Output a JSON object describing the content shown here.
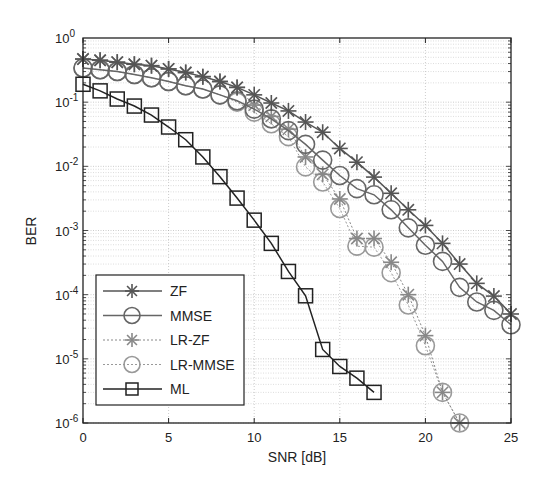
{
  "chart_data": {
    "type": "line",
    "title": "",
    "xlabel": "SNR [dB]",
    "ylabel": "BER",
    "xlim": [
      0,
      25
    ],
    "ylim": [
      1e-06,
      1
    ],
    "yscale": "log",
    "grid": true,
    "legend_position": "lower left",
    "x_ticks": [
      0,
      5,
      10,
      15,
      20,
      25
    ],
    "y_ticks": [
      {
        "exp": 0,
        "label": "10",
        "sup": "0"
      },
      {
        "exp": -1,
        "label": "10",
        "sup": "-1"
      },
      {
        "exp": -2,
        "label": "10",
        "sup": "-2"
      },
      {
        "exp": -3,
        "label": "10",
        "sup": "-3"
      },
      {
        "exp": -4,
        "label": "10",
        "sup": "-4"
      },
      {
        "exp": -5,
        "label": "10",
        "sup": "-5"
      },
      {
        "exp": -6,
        "label": "10",
        "sup": "-6"
      }
    ],
    "series": [
      {
        "name": "ZF",
        "marker": "star",
        "color": "#555555",
        "line": "solid",
        "x": [
          0,
          1,
          2,
          3,
          4,
          5,
          6,
          7,
          8,
          9,
          10,
          11,
          12,
          13,
          14,
          15,
          16,
          17,
          18,
          19,
          20,
          21,
          22,
          23,
          24,
          25
        ],
        "values": [
          0.47,
          0.45,
          0.42,
          0.39,
          0.37,
          0.33,
          0.29,
          0.25,
          0.21,
          0.17,
          0.13,
          0.097,
          0.073,
          0.049,
          0.034,
          0.019,
          0.0116,
          0.0068,
          0.0038,
          0.0021,
          0.0012,
          0.00063,
          0.0003,
          0.00015,
          9.5e-05,
          5e-05
        ]
      },
      {
        "name": "MMSE",
        "marker": "circle",
        "color": "#666666",
        "line": "solid",
        "x": [
          0,
          1,
          2,
          3,
          4,
          5,
          6,
          7,
          8,
          9,
          10,
          11,
          12,
          13,
          14,
          15,
          16,
          17,
          18,
          19,
          20,
          21,
          22,
          23,
          24,
          25
        ],
        "values": [
          0.34,
          0.32,
          0.3,
          0.27,
          0.24,
          0.21,
          0.18,
          0.16,
          0.13,
          0.105,
          0.078,
          0.055,
          0.036,
          0.022,
          0.0125,
          0.0072,
          0.0045,
          0.0036,
          0.0021,
          0.0011,
          0.00059,
          0.00033,
          0.00013,
          7.7e-05,
          5.7e-05,
          3.4e-05
        ]
      },
      {
        "name": "LR-ZF",
        "marker": "star",
        "color": "#888888",
        "line": "dotted",
        "x": [
          0,
          1,
          2,
          3,
          4,
          5,
          6,
          7,
          8,
          9,
          10,
          11,
          12,
          13,
          14,
          15,
          16,
          17,
          18,
          19,
          20,
          21,
          22
        ],
        "values": [
          0.47,
          0.45,
          0.42,
          0.39,
          0.37,
          0.33,
          0.29,
          0.25,
          0.21,
          0.17,
          0.09,
          0.06,
          0.038,
          0.014,
          0.0075,
          0.0031,
          0.00075,
          0.00075,
          0.00032,
          0.0001,
          2.3e-05,
          3e-06,
          1e-06
        ]
      },
      {
        "name": "LR-MMSE",
        "marker": "circle",
        "color": "#999999",
        "line": "dotted",
        "x": [
          0,
          1,
          2,
          3,
          4,
          5,
          6,
          7,
          8,
          9,
          10,
          11,
          12,
          13,
          14,
          15,
          16,
          17,
          18,
          19,
          20,
          21,
          22
        ],
        "values": [
          0.34,
          0.32,
          0.3,
          0.27,
          0.24,
          0.21,
          0.18,
          0.16,
          0.13,
          0.1,
          0.07,
          0.046,
          0.029,
          0.0098,
          0.0057,
          0.0022,
          0.00057,
          0.00055,
          0.00022,
          6.9e-05,
          1.6e-05,
          3e-06,
          1e-06
        ]
      },
      {
        "name": "ML",
        "marker": "square",
        "color": "#222222",
        "line": "solid",
        "x": [
          0,
          1,
          2,
          3,
          4,
          5,
          6,
          7,
          8,
          9,
          10,
          11,
          12,
          13,
          14,
          15,
          16,
          17
        ],
        "values": [
          0.19,
          0.15,
          0.112,
          0.087,
          0.063,
          0.041,
          0.026,
          0.014,
          0.0069,
          0.0032,
          0.00145,
          0.00063,
          0.00023,
          9.6e-05,
          1.4e-05,
          7.6e-06,
          5e-06,
          3e-06
        ]
      }
    ]
  },
  "legend": {
    "items": [
      {
        "label": "ZF"
      },
      {
        "label": "MMSE"
      },
      {
        "label": "LR-ZF"
      },
      {
        "label": "LR-MMSE"
      },
      {
        "label": "ML"
      }
    ]
  }
}
